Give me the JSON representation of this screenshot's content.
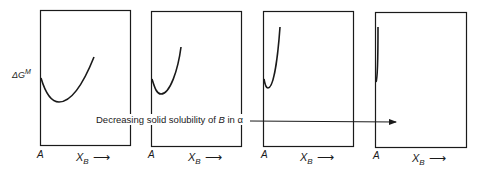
{
  "figure": {
    "y_axis_label": {
      "main": "ΔG",
      "sup": "M"
    },
    "caption": {
      "prefix": "Decreasing solid solubility of ",
      "species": "B",
      "mid": " in ",
      "phase": "α"
    },
    "panels": [
      {
        "origin_label": "A",
        "x_label_main": "X",
        "x_label_sub": "B",
        "x_arrow": "⟶"
      },
      {
        "origin_label": "A",
        "x_label_main": "X",
        "x_label_sub": "B",
        "x_arrow": "⟶"
      },
      {
        "origin_label": "A",
        "x_label_main": "X",
        "x_label_sub": "B",
        "x_arrow": "⟶"
      },
      {
        "origin_label": "A",
        "x_label_main": "X",
        "x_label_sub": "B",
        "x_arrow": "⟶"
      }
    ]
  },
  "colors": {
    "ink": "#1a1a1a",
    "background": "#ffffff"
  }
}
